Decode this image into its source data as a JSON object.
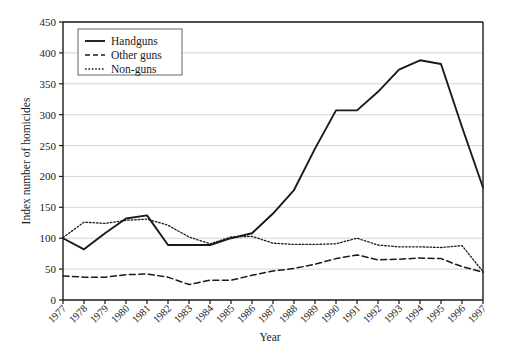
{
  "chart_data": {
    "type": "line",
    "title": "",
    "xlabel": "Year",
    "ylabel": "Index number of homicides",
    "xlim": [
      1977,
      1997
    ],
    "ylim": [
      0,
      450
    ],
    "grid": true,
    "legend_position": "top-left",
    "y_ticks": [
      0,
      50,
      100,
      150,
      200,
      250,
      300,
      350,
      400,
      450
    ],
    "categories": [
      "1977",
      "1978",
      "1979",
      "1980",
      "1981",
      "1982",
      "1983",
      "1984",
      "1985",
      "1986",
      "1987",
      "1988",
      "1989",
      "1990",
      "1991",
      "1992",
      "1993",
      "1994",
      "1995",
      "1996",
      "1997"
    ],
    "series": [
      {
        "name": "Handguns",
        "style": "solid",
        "values": [
          100,
          82,
          108,
          132,
          137,
          89,
          89,
          89,
          100,
          108,
          140,
          178,
          245,
          307,
          307,
          337,
          373,
          388,
          382,
          280,
          182
        ]
      },
      {
        "name": "Other guns",
        "style": "dashed",
        "values": [
          39,
          37,
          37,
          41,
          42,
          37,
          25,
          32,
          32,
          40,
          47,
          51,
          58,
          67,
          73,
          65,
          66,
          68,
          67,
          54,
          45
        ]
      },
      {
        "name": "Non-guns",
        "style": "dotted",
        "values": [
          101,
          126,
          124,
          129,
          131,
          121,
          102,
          91,
          102,
          103,
          92,
          90,
          90,
          91,
          100,
          89,
          86,
          86,
          85,
          88,
          46
        ]
      }
    ]
  },
  "legend": {
    "entries": [
      {
        "label": "Handguns",
        "style": "solid"
      },
      {
        "label": "Other guns",
        "style": "dashed"
      },
      {
        "label": "Non-guns",
        "style": "dotted"
      }
    ]
  },
  "axes": {
    "y_title": "Index number of homicides",
    "x_title": "Year"
  }
}
